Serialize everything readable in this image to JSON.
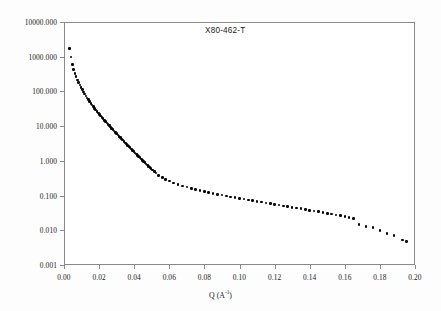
{
  "figure": {
    "background_color": "#ffffff",
    "frame_color": "#8a8a8a",
    "marker_color": "#000000"
  },
  "annotation": {
    "label": "X80-462-T"
  },
  "axes": {
    "x": {
      "title_prefix": "Q (A",
      "title_exponent": "-1",
      "title_suffix": ")",
      "title_full": "Q (A-1)",
      "ticks": [
        "0.00",
        "0.02",
        "0.04",
        "0.06",
        "0.08",
        "0.10",
        "0.12",
        "0.14",
        "0.16",
        "0.18",
        "0.20"
      ],
      "min": 0.0,
      "max": 0.2
    },
    "y": {
      "title_full": "dΣ/dΩ (cm-1 sr-1)",
      "title_part1": "dΣ/dΩ (cm",
      "title_exp1": "-1",
      "title_part2": " sr",
      "title_exp2": "-1",
      "title_part3": ")",
      "ticks": [
        "10000.000",
        "1000.000",
        "100.000",
        "10.000",
        "1.000",
        "0.100",
        "0.010",
        "0.001"
      ],
      "min": 0.001,
      "max": 10000.0,
      "scale": "log"
    }
  },
  "chart_data": {
    "type": "scatter",
    "title": "X80-462-T",
    "xlabel": "Q (A-1)",
    "ylabel": "dΣ/dΩ (cm-1 sr-1)",
    "xlim": [
      0.0,
      0.2
    ],
    "ylim": [
      0.001,
      10000.0
    ],
    "yscale": "log",
    "xscale": "linear",
    "grid": false,
    "legend": false,
    "marker": "filled-circle",
    "marker_color": "#000000",
    "series": [
      {
        "name": "X80-462-T",
        "x": [
          0.0032,
          0.004,
          0.0048,
          0.0055,
          0.0062,
          0.0069,
          0.0076,
          0.0083,
          0.009,
          0.0097,
          0.0104,
          0.0111,
          0.0118,
          0.0125,
          0.0132,
          0.0139,
          0.0146,
          0.0153,
          0.016,
          0.0167,
          0.0174,
          0.0181,
          0.0188,
          0.0195,
          0.0202,
          0.0209,
          0.0216,
          0.0223,
          0.023,
          0.0237,
          0.0244,
          0.0251,
          0.0258,
          0.0265,
          0.0272,
          0.0279,
          0.0286,
          0.0293,
          0.03,
          0.0307,
          0.0314,
          0.0321,
          0.0328,
          0.0335,
          0.0342,
          0.0349,
          0.0356,
          0.0363,
          0.037,
          0.0377,
          0.0384,
          0.0391,
          0.0398,
          0.0405,
          0.0412,
          0.0419,
          0.0426,
          0.0433,
          0.044,
          0.0447,
          0.0454,
          0.0461,
          0.0468,
          0.0475,
          0.0482,
          0.0489,
          0.0496,
          0.0505,
          0.0515,
          0.0525,
          0.054,
          0.056,
          0.058,
          0.06,
          0.0625,
          0.065,
          0.0675,
          0.07,
          0.0725,
          0.075,
          0.0775,
          0.08,
          0.0825,
          0.085,
          0.0875,
          0.09,
          0.0925,
          0.095,
          0.0975,
          0.1,
          0.1025,
          0.105,
          0.1075,
          0.11,
          0.1125,
          0.115,
          0.1175,
          0.12,
          0.1225,
          0.125,
          0.1275,
          0.13,
          0.1325,
          0.135,
          0.1375,
          0.14,
          0.1425,
          0.145,
          0.1475,
          0.15,
          0.1525,
          0.155,
          0.1575,
          0.16,
          0.1625,
          0.165,
          0.168,
          0.172,
          0.176,
          0.18,
          0.184,
          0.188,
          0.193,
          0.195
        ],
        "y": [
          1750.0,
          980.0,
          600.0,
          430.0,
          330.0,
          265.0,
          215.0,
          180.0,
          152.0,
          130.0,
          112.0,
          97.0,
          85.0,
          74.0,
          65.0,
          57.5,
          51.0,
          45.5,
          40.5,
          36.5,
          32.8,
          29.5,
          26.6,
          24.0,
          21.7,
          19.7,
          17.9,
          16.3,
          14.8,
          13.5,
          12.3,
          11.2,
          10.3,
          9.4,
          8.6,
          7.9,
          7.2,
          6.6,
          6.05,
          5.55,
          5.1,
          4.7,
          4.3,
          3.95,
          3.6,
          3.3,
          3.05,
          2.8,
          2.58,
          2.38,
          2.18,
          2.0,
          1.85,
          1.7,
          1.57,
          1.45,
          1.33,
          1.23,
          1.13,
          1.04,
          0.96,
          0.89,
          0.82,
          0.76,
          0.7,
          0.65,
          0.6,
          0.545,
          0.49,
          0.445,
          0.385,
          0.33,
          0.292,
          0.262,
          0.232,
          0.208,
          0.19,
          0.175,
          0.162,
          0.15,
          0.14,
          0.131,
          0.123,
          0.116,
          0.109,
          0.103,
          0.0975,
          0.0922,
          0.0875,
          0.083,
          0.0788,
          0.0748,
          0.0712,
          0.0678,
          0.0645,
          0.0614,
          0.0585,
          0.0557,
          0.0531,
          0.0506,
          0.0482,
          0.0459,
          0.0437,
          0.0416,
          0.0396,
          0.0377,
          0.0359,
          0.0341,
          0.0324,
          0.0308,
          0.0292,
          0.0277,
          0.0262,
          0.0248,
          0.0234,
          0.022,
          0.0148,
          0.013,
          0.0118,
          0.0099,
          0.0081,
          0.007,
          0.0053,
          0.0048
        ]
      }
    ]
  }
}
